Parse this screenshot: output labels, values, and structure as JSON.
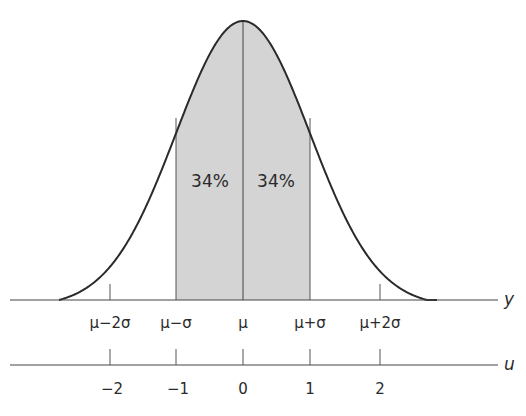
{
  "chart_data": {
    "type": "area",
    "title": "",
    "shaded_region": {
      "from": -1,
      "to": 1,
      "color": "#d4d4d4"
    },
    "annotations": [
      {
        "text": "34%",
        "region": "mu-sigma to mu"
      },
      {
        "text": "34%",
        "region": "mu to mu+sigma"
      }
    ],
    "axes": [
      {
        "name": "y",
        "label": "y",
        "ticks": [
          "μ−2σ",
          "μ−σ",
          "μ",
          "μ+σ",
          "μ+2σ"
        ]
      },
      {
        "name": "u",
        "label": "u",
        "ticks": [
          "−2",
          "−1",
          "0",
          "1",
          "2"
        ]
      }
    ],
    "xlim": [
      -2.8,
      2.9
    ],
    "grid": false
  },
  "labels": {
    "pct_left": "34%",
    "pct_right": "34%",
    "y_axis": "y",
    "u_axis": "u",
    "y_ticks": [
      "μ−2σ",
      "μ−σ",
      "μ",
      "μ+σ",
      "μ+2σ"
    ],
    "u_ticks": [
      "−2",
      "−1",
      "0",
      "1",
      "2"
    ]
  }
}
